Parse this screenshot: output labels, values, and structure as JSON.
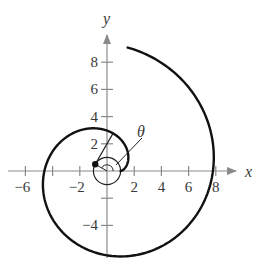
{
  "figure": {
    "title": "",
    "x_axis_label": "x",
    "y_axis_label": "y",
    "angle_label": "θ",
    "x_ticks": [
      {
        "value": -6,
        "label": "−6"
      },
      {
        "value": -4,
        "label": ""
      },
      {
        "value": -2,
        "label": "−2"
      },
      {
        "value": 2,
        "label": "2"
      },
      {
        "value": 4,
        "label": "4"
      },
      {
        "value": 6,
        "label": "6"
      },
      {
        "value": 8,
        "label": "8"
      }
    ],
    "y_ticks": [
      {
        "value": 8,
        "label": "8"
      },
      {
        "value": 6,
        "label": "6"
      },
      {
        "value": 4,
        "label": "4"
      },
      {
        "value": 2,
        "label": "2"
      },
      {
        "value": -2,
        "label": ""
      },
      {
        "value": -4,
        "label": "−4"
      }
    ],
    "curve": {
      "type": "involute-of-circle",
      "circle_radius": 1,
      "t_start": 0,
      "t_end": 9.15
    },
    "tangent_point_angle_deg": 150,
    "colors": {
      "curve": "#111111",
      "axes": "#8a8a8a",
      "text": "#3a3a3a"
    }
  }
}
